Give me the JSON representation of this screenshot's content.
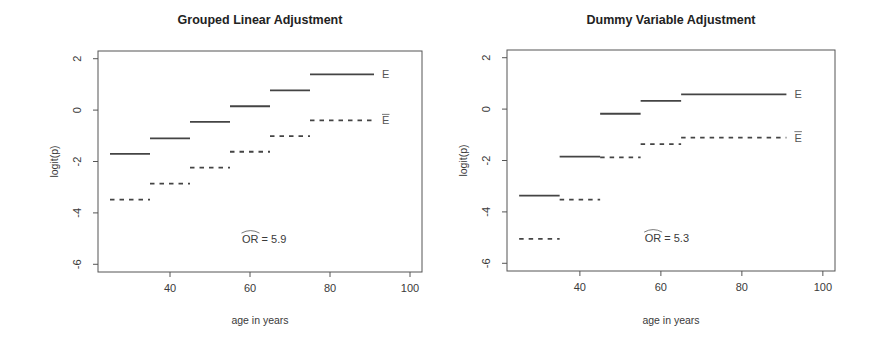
{
  "chart_data": [
    {
      "type": "line",
      "style": "step-segments",
      "title": "Grouped Linear Adjustment",
      "xlabel": "age in years",
      "ylabel": "logit(p)",
      "xlim": [
        22,
        103
      ],
      "ylim": [
        -6.3,
        2.3
      ],
      "xticks": [
        40,
        60,
        80,
        100
      ],
      "yticks": [
        2,
        0,
        -2,
        -4,
        -6
      ],
      "grid": false,
      "legend": "inline labels at right end of series",
      "annotation": {
        "text": "OR = 5.9",
        "hat_over": "OR",
        "value": 5.9,
        "x": 58,
        "y": -5.0
      },
      "series": [
        {
          "name": "E",
          "line_style": "solid",
          "segments": [
            {
              "x0": 25,
              "x1": 35,
              "y": -1.7
            },
            {
              "x0": 35,
              "x1": 45,
              "y": -1.1
            },
            {
              "x0": 45,
              "x1": 55,
              "y": -0.46
            },
            {
              "x0": 55,
              "x1": 65,
              "y": 0.15
            },
            {
              "x0": 65,
              "x1": 75,
              "y": 0.77
            },
            {
              "x0": 75,
              "x1": 91,
              "y": 1.39
            }
          ]
        },
        {
          "name": "E-bar",
          "display": "Ē",
          "line_style": "dashed",
          "segments": [
            {
              "x0": 25,
              "x1": 35,
              "y": -3.48
            },
            {
              "x0": 35,
              "x1": 45,
              "y": -2.86
            },
            {
              "x0": 45,
              "x1": 55,
              "y": -2.24
            },
            {
              "x0": 55,
              "x1": 65,
              "y": -1.62
            },
            {
              "x0": 65,
              "x1": 75,
              "y": -1.01
            },
            {
              "x0": 75,
              "x1": 91,
              "y": -0.4
            }
          ]
        }
      ]
    },
    {
      "type": "line",
      "style": "step-segments",
      "title": "Dummy Variable Adjustment",
      "xlabel": "age in years",
      "ylabel": "logit(p)",
      "xlim": [
        22,
        103
      ],
      "ylim": [
        -6.3,
        2.3
      ],
      "xticks": [
        40,
        60,
        80,
        100
      ],
      "yticks": [
        2,
        0,
        -2,
        -4,
        -6
      ],
      "grid": false,
      "legend": "inline labels at right end of series",
      "annotation": {
        "text": "OR = 5.3",
        "hat_over": "OR",
        "value": 5.3,
        "x": 56,
        "y": -5.0
      },
      "series": [
        {
          "name": "E",
          "line_style": "solid",
          "segments": [
            {
              "x0": 25,
              "x1": 35,
              "y": -3.37
            },
            {
              "x0": 35,
              "x1": 45,
              "y": -1.85
            },
            {
              "x0": 45,
              "x1": 55,
              "y": -0.18
            },
            {
              "x0": 55,
              "x1": 65,
              "y": 0.32
            },
            {
              "x0": 65,
              "x1": 91,
              "y": 0.57
            }
          ]
        },
        {
          "name": "E-bar",
          "display": "Ē",
          "line_style": "dashed",
          "segments": [
            {
              "x0": 25,
              "x1": 35,
              "y": -5.05
            },
            {
              "x0": 35,
              "x1": 45,
              "y": -3.52
            },
            {
              "x0": 45,
              "x1": 55,
              "y": -1.88
            },
            {
              "x0": 55,
              "x1": 65,
              "y": -1.36
            },
            {
              "x0": 65,
              "x1": 91,
              "y": -1.11
            }
          ]
        }
      ]
    }
  ],
  "layout": {
    "panels": [
      {
        "box": [
          98,
          51,
          422,
          272
        ],
        "title_y": 24,
        "xlabel_y": 324,
        "ylabel_x": 58
      },
      {
        "box": [
          507,
          50,
          835,
          271
        ],
        "title_y": 24,
        "xlabel_y": 324,
        "ylabel_x": 467
      }
    ],
    "colors": {
      "line": "#444444",
      "axis": "#555555",
      "text": "#333333"
    }
  }
}
